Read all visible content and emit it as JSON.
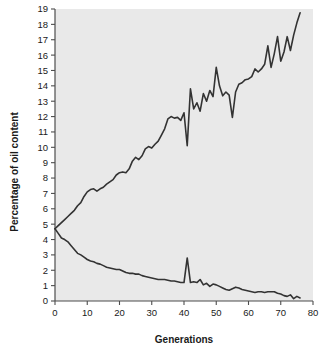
{
  "chart_data": {
    "type": "line",
    "title": "",
    "subtitle": "",
    "xlabel": "Generations",
    "ylabel": "Percentage of oil content",
    "xlim": [
      0,
      80
    ],
    "ylim": [
      0,
      19
    ],
    "xticks": [
      0,
      10,
      20,
      30,
      40,
      50,
      60,
      70,
      80
    ],
    "yticks": [
      0,
      1,
      2,
      3,
      4,
      5,
      6,
      7,
      8,
      9,
      10,
      11,
      12,
      13,
      14,
      15,
      16,
      17,
      18,
      19
    ],
    "xtick_labels": [
      "0",
      "10",
      "20",
      "30",
      "40",
      "50",
      "60",
      "70",
      "80"
    ],
    "ytick_labels": [
      "0",
      "1",
      "2",
      "3",
      "4",
      "5",
      "6",
      "7",
      "8",
      "9",
      "10",
      "11",
      "12",
      "13",
      "14",
      "15",
      "16",
      "17",
      "18",
      "19"
    ],
    "grid": false,
    "legend": null,
    "legend_position": "none",
    "plot_background": "#e9e9e9",
    "line_color": "#333333",
    "line_width": 1.6,
    "series": [
      {
        "name": "Illinois High Oil",
        "color": "#333333",
        "x": [
          0,
          1,
          2,
          3,
          4,
          5,
          6,
          7,
          8,
          9,
          10,
          11,
          12,
          13,
          14,
          15,
          16,
          17,
          18,
          19,
          20,
          21,
          22,
          23,
          24,
          25,
          26,
          27,
          28,
          29,
          30,
          31,
          32,
          33,
          34,
          35,
          36,
          37,
          38,
          39,
          40,
          41,
          42,
          43,
          44,
          45,
          46,
          47,
          48,
          49,
          50,
          51,
          52,
          53,
          54,
          55,
          56,
          57,
          58,
          59,
          60,
          61,
          62,
          63,
          64,
          65,
          66,
          67,
          68,
          69,
          70,
          71,
          72,
          73,
          74,
          75,
          76
        ],
        "values": [
          4.7,
          4.9,
          5.1,
          5.3,
          5.5,
          5.7,
          5.9,
          6.2,
          6.4,
          6.8,
          7.1,
          7.25,
          7.3,
          7.15,
          7.3,
          7.4,
          7.6,
          7.75,
          7.9,
          8.2,
          8.35,
          8.4,
          8.35,
          8.6,
          9.1,
          9.35,
          9.2,
          9.45,
          9.9,
          10.05,
          9.95,
          10.2,
          10.4,
          10.8,
          11.2,
          11.85,
          12.0,
          11.9,
          11.95,
          11.75,
          12.25,
          10.1,
          13.8,
          12.5,
          12.9,
          12.35,
          13.5,
          13.0,
          13.7,
          13.3,
          15.2,
          14.0,
          13.35,
          13.6,
          13.4,
          11.95,
          13.6,
          14.1,
          14.2,
          14.4,
          14.45,
          14.6,
          15.1,
          14.9,
          15.1,
          15.4,
          16.6,
          15.2,
          16.1,
          17.2,
          15.6,
          16.2,
          17.2,
          16.3,
          17.3,
          18.1,
          18.75
        ]
      },
      {
        "name": "Illinois Low Oil",
        "color": "#333333",
        "x": [
          0,
          1,
          2,
          3,
          4,
          5,
          6,
          7,
          8,
          9,
          10,
          11,
          12,
          13,
          14,
          15,
          16,
          17,
          18,
          19,
          20,
          21,
          22,
          23,
          24,
          25,
          26,
          27,
          28,
          29,
          30,
          31,
          32,
          33,
          34,
          35,
          36,
          37,
          38,
          39,
          40,
          41,
          42,
          43,
          44,
          45,
          46,
          47,
          48,
          49,
          50,
          51,
          52,
          53,
          54,
          55,
          56,
          57,
          58,
          59,
          60,
          61,
          62,
          63,
          64,
          65,
          66,
          67,
          68,
          69,
          70,
          71,
          72,
          73,
          74,
          75,
          76
        ],
        "values": [
          4.7,
          4.4,
          4.1,
          4.0,
          3.85,
          3.6,
          3.35,
          3.1,
          3.0,
          2.85,
          2.7,
          2.6,
          2.55,
          2.45,
          2.4,
          2.3,
          2.2,
          2.15,
          2.1,
          2.05,
          2.05,
          1.95,
          1.85,
          1.8,
          1.8,
          1.75,
          1.75,
          1.65,
          1.6,
          1.55,
          1.5,
          1.45,
          1.4,
          1.4,
          1.4,
          1.35,
          1.3,
          1.3,
          1.25,
          1.2,
          1.2,
          2.8,
          1.2,
          1.25,
          1.2,
          1.4,
          1.05,
          1.15,
          0.95,
          1.1,
          1.05,
          0.95,
          0.85,
          0.75,
          0.7,
          0.8,
          0.9,
          0.85,
          0.75,
          0.7,
          0.65,
          0.6,
          0.55,
          0.6,
          0.6,
          0.55,
          0.6,
          0.6,
          0.6,
          0.5,
          0.45,
          0.35,
          0.3,
          0.4,
          0.15,
          0.3,
          0.2
        ]
      }
    ],
    "annotations": []
  },
  "figure": {
    "xlabel_text": "Generations",
    "ylabel_text": "Percentage of oil content"
  }
}
